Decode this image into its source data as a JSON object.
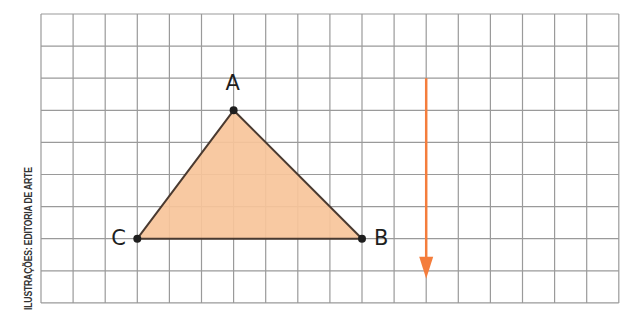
{
  "credit": "ILUSTRAÇÕES: EDITORIA DE ARTE",
  "grid": {
    "left": 41,
    "top": 14,
    "cell": 32.1,
    "cols": 18,
    "rows": 9,
    "line_color": "#9a9a9a"
  },
  "triangle": {
    "fill": "#f7c49a",
    "stroke": "#4a3a30",
    "vertices": [
      {
        "name": "A",
        "col": 6,
        "row": 3,
        "label_dx": 0,
        "label_dy": -26
      },
      {
        "name": "B",
        "col": 10,
        "row": 7,
        "label_dx": 20,
        "label_dy": 0
      },
      {
        "name": "C",
        "col": 3,
        "row": 7,
        "label_dx": -18,
        "label_dy": 0
      }
    ]
  },
  "arrow": {
    "color": "#f47d3c",
    "col": 12,
    "start_row": 2,
    "end_row": 8.25,
    "direction": "down"
  },
  "labels": {
    "A": "A",
    "B": "B",
    "C": "C"
  }
}
